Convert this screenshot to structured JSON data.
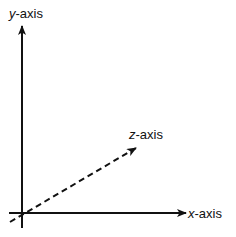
{
  "diagram": {
    "type": "3d-coordinate-axes",
    "axes": [
      {
        "id": "y",
        "var": "y",
        "suffix": "-axis",
        "style": "solid"
      },
      {
        "id": "x",
        "var": "x",
        "suffix": "-axis",
        "style": "solid"
      },
      {
        "id": "z",
        "var": "z",
        "suffix": "-axis",
        "style": "dashed"
      }
    ],
    "colors": {
      "line": "#111111",
      "background": "#ffffff"
    }
  }
}
